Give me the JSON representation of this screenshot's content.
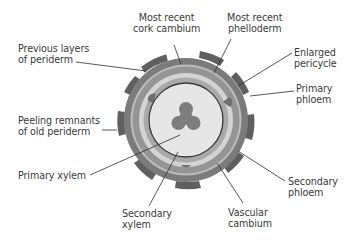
{
  "diagram": {
    "type": "cross-section",
    "center": [
      186,
      120
    ],
    "colors": {
      "bark_patch": "#5f5f5f",
      "periderm_outer": "#7b7b7b",
      "cork_cambium_band": "#bcbcbc",
      "phelloderm": "#959595",
      "pericycle": "#d4d4d4",
      "secondary_phloem": "#a9a9a9",
      "vascular_cambium_line": "#3a3a3a",
      "secondary_xylem": "#e6e6e6",
      "primary_xylem": "#7d7d7d",
      "leader_line": "#2d2d2d",
      "label_text": "#3a3a3a"
    }
  },
  "labels": {
    "most_recent_cork_cambium": {
      "line1": "Most recent",
      "line2": "cork cambium"
    },
    "most_recent_phelloderm": {
      "line1": "Most recent",
      "line2": "phelloderm"
    },
    "previous_layers_periderm": {
      "line1": "Previous layers",
      "line2": "of periderm"
    },
    "enlarged_pericycle": {
      "line1": "Enlarged",
      "line2": "pericycle"
    },
    "primary_phloem": {
      "line1": "Primary",
      "line2": "phloem"
    },
    "peeling_remnants": {
      "line1": "Peeling remnants",
      "line2": "of old periderm"
    },
    "primary_xylem": {
      "line1": "Primary xylem"
    },
    "secondary_phloem": {
      "line1": "Secondary",
      "line2": "phloem"
    },
    "secondary_xylem": {
      "line1": "Secondary",
      "line2": "xylem"
    },
    "vascular_cambium": {
      "line1": "Vascular",
      "line2": "cambium"
    }
  }
}
